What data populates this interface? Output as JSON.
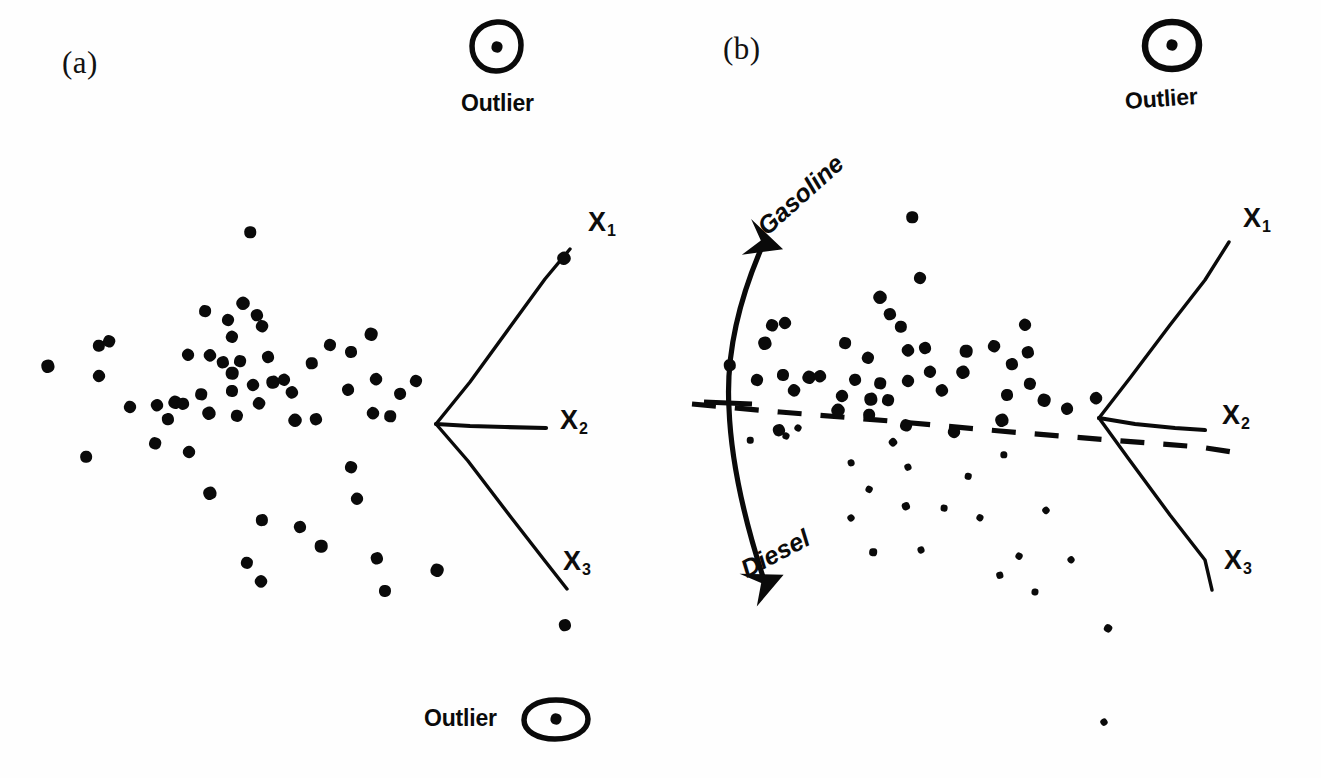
{
  "figure": {
    "background_color": "#fefefe",
    "ink_color": "#0a0a0a",
    "width": 1321,
    "height": 778
  },
  "panels": [
    {
      "id": "a",
      "label": "(a)",
      "label_pos": {
        "x": 62,
        "y": 45
      },
      "axis_origin": {
        "x": 436,
        "y": 424
      },
      "axes": [
        {
          "name": "X1",
          "label": "X",
          "subscript": "1",
          "label_pos": {
            "x": 588,
            "y": 207
          },
          "end": {
            "x": 570,
            "y": 249
          }
        },
        {
          "name": "X2",
          "label": "X",
          "subscript": "2",
          "label_pos": {
            "x": 560,
            "y": 405
          },
          "end": {
            "x": 546,
            "y": 428
          }
        },
        {
          "name": "X3",
          "label": "X",
          "subscript": "3",
          "label_pos": {
            "x": 563,
            "y": 546
          },
          "end": {
            "x": 567,
            "y": 589
          }
        }
      ],
      "annotations": [
        {
          "type": "outlier",
          "text": "Outlier",
          "marker_pos": {
            "x": 497,
            "y": 47
          },
          "text_pos": {
            "x": 461,
            "y": 90
          },
          "layout": "marker-above-text"
        },
        {
          "type": "outlier",
          "text": "Outlier",
          "marker_pos": {
            "x": 556,
            "y": 719
          },
          "text_pos": {
            "x": 424,
            "y": 705
          },
          "layout": "marker-right-of-text"
        }
      ]
    },
    {
      "id": "b",
      "label": "(b)",
      "label_pos": {
        "x": 723,
        "y": 31
      },
      "axis_origin": {
        "x": 1099,
        "y": 418
      },
      "axes": [
        {
          "name": "X1",
          "label": "X",
          "subscript": "1",
          "label_pos": {
            "x": 1243,
            "y": 203
          },
          "end": {
            "x": 1229,
            "y": 242
          }
        },
        {
          "name": "X2",
          "label": "X",
          "subscript": "2",
          "label_pos": {
            "x": 1222,
            "y": 400
          },
          "end": {
            "x": 1205,
            "y": 430
          }
        },
        {
          "name": "X3",
          "label": "X",
          "subscript": "3",
          "label_pos": {
            "x": 1224,
            "y": 545
          },
          "end": {
            "x": 1212,
            "y": 590
          }
        }
      ],
      "annotations": [
        {
          "type": "outlier",
          "text": "Outlier",
          "marker_pos": {
            "x": 1172,
            "y": 45
          },
          "text_pos": {
            "x": 1127,
            "y": 88
          },
          "layout": "marker-above-text"
        },
        {
          "type": "separator",
          "style": "dashed",
          "start": {
            "x": 692,
            "y": 404
          },
          "end": {
            "x": 1232,
            "y": 452
          }
        },
        {
          "type": "double-arrow",
          "labels": {
            "up": "Gasoline",
            "down": "Diesel"
          },
          "up_label_pos": {
            "x": 771,
            "y": 232
          },
          "down_label_pos": {
            "x": 736,
            "y": 560
          },
          "arrow_top": {
            "x": 765,
            "y": 238
          },
          "arrow_bottom": {
            "x": 736,
            "y": 585
          }
        }
      ]
    }
  ],
  "chart_data": {
    "type": "scatter",
    "title": "",
    "xlabel": "",
    "ylabel": "",
    "grid": false,
    "legend": "none",
    "panels": [
      {
        "name": "(a)",
        "description": "Undivided point cloud with one circled outlier above and one circled outlier below; three-ray biplot axes X1, X2, X3 at right.",
        "points": [
          [
            250,
            232
          ],
          [
            228,
            320
          ],
          [
            243,
            303
          ],
          [
            257,
            315
          ],
          [
            99,
            346
          ],
          [
            109,
            341
          ],
          [
            99,
            376
          ],
          [
            48,
            366
          ],
          [
            205,
            311
          ],
          [
            232,
            337
          ],
          [
            210,
            355
          ],
          [
            268,
            357
          ],
          [
            232,
            373
          ],
          [
            262,
            326
          ],
          [
            188,
            355
          ],
          [
            223,
            362
          ],
          [
            232,
            391
          ],
          [
            175,
            402
          ],
          [
            157,
            405
          ],
          [
            183,
            404
          ],
          [
            201,
            394
          ],
          [
            130,
            407
          ],
          [
            209,
            413
          ],
          [
            168,
            419
          ],
          [
            237,
            416
          ],
          [
            259,
            403
          ],
          [
            253,
            385
          ],
          [
            273,
            382
          ],
          [
            240,
            361
          ],
          [
            284,
            380
          ],
          [
            292,
            392
          ],
          [
            351,
            352
          ],
          [
            371,
            334
          ],
          [
            376,
            379
          ],
          [
            348,
            390
          ],
          [
            312,
            363
          ],
          [
            330,
            345
          ],
          [
            295,
            420
          ],
          [
            316,
            419
          ],
          [
            86,
            457
          ],
          [
            155,
            443
          ],
          [
            189,
            452
          ],
          [
            210,
            493
          ],
          [
            262,
            520
          ],
          [
            247,
            563
          ],
          [
            261,
            581
          ],
          [
            300,
            527
          ],
          [
            321,
            546
          ],
          [
            351,
            467
          ],
          [
            357,
            499
          ],
          [
            377,
            558
          ],
          [
            385,
            591
          ],
          [
            437,
            570
          ],
          [
            373,
            413
          ],
          [
            400,
            394
          ],
          [
            390,
            416
          ],
          [
            416,
            381
          ],
          [
            564,
            258
          ],
          [
            565,
            625
          ]
        ],
        "outlier_markers": [
          [
            497,
            47
          ],
          [
            556,
            719
          ]
        ]
      },
      {
        "name": "(b)",
        "description": "Same cloud split by a dashed line into a gasoline group (above) and a diesel group (below, drawn with smaller dots); double-headed curved arrow labels the two directions.",
        "points_above": [
          [
            912,
            217
          ],
          [
            920,
            278
          ],
          [
            880,
            297
          ],
          [
            890,
            314
          ],
          [
            901,
            327
          ],
          [
            772,
            325
          ],
          [
            785,
            323
          ],
          [
            765,
            343
          ],
          [
            845,
            343
          ],
          [
            868,
            358
          ],
          [
            908,
            350
          ],
          [
            925,
            348
          ],
          [
            966,
            351
          ],
          [
            994,
            346
          ],
          [
            1025,
            325
          ],
          [
            1028,
            352
          ],
          [
            783,
            375
          ],
          [
            809,
            377
          ],
          [
            820,
            376
          ],
          [
            855,
            380
          ],
          [
            880,
            383
          ],
          [
            908,
            381
          ],
          [
            963,
            372
          ],
          [
            1012,
            364
          ],
          [
            1030,
            384
          ],
          [
            794,
            390
          ],
          [
            842,
            396
          ],
          [
            871,
            399
          ],
          [
            888,
            400
          ],
          [
            930,
            372
          ],
          [
            942,
            390
          ],
          [
            1007,
            395
          ],
          [
            1044,
            400
          ],
          [
            1096,
            398
          ],
          [
            1067,
            409
          ],
          [
            730,
            365
          ],
          [
            757,
            380
          ],
          [
            838,
            410
          ],
          [
            779,
            430
          ],
          [
            869,
            415
          ],
          [
            906,
            425
          ],
          [
            954,
            432
          ],
          [
            1002,
            420
          ]
        ],
        "points_below": [
          [
            750,
            440
          ],
          [
            786,
            436
          ],
          [
            893,
            442
          ],
          [
            908,
            467
          ],
          [
            1004,
            455
          ],
          [
            869,
            489
          ],
          [
            851,
            518
          ],
          [
            906,
            506
          ],
          [
            944,
            508
          ],
          [
            980,
            518
          ],
          [
            1046,
            510
          ],
          [
            921,
            550
          ],
          [
            873,
            552
          ],
          [
            1019,
            556
          ],
          [
            1071,
            560
          ],
          [
            1000,
            575
          ],
          [
            1035,
            592
          ],
          [
            1108,
            628
          ],
          [
            1104,
            722
          ],
          [
            851,
            463
          ],
          [
            968,
            476
          ],
          [
            798,
            428
          ]
        ],
        "outlier_markers": [
          [
            1172,
            45
          ]
        ]
      }
    ]
  }
}
